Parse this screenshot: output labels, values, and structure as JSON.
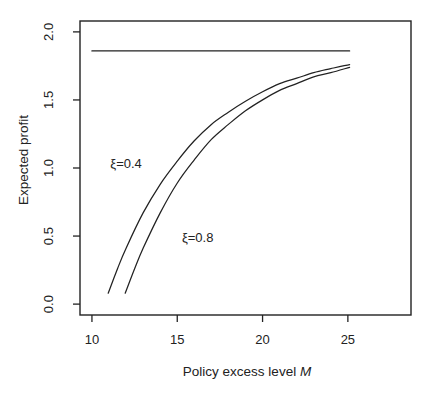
{
  "window": {
    "width": 430,
    "height": 397
  },
  "figure": {
    "background": "#ffffff",
    "ink_color": "#222222"
  },
  "chart_data": {
    "type": "line",
    "title": "",
    "xlabel": "Policy excess level M",
    "xlabel_text": "Policy excess level ",
    "xlabel_var": "M",
    "ylabel": "Expected profit",
    "xlim": [
      9.3,
      28.7
    ],
    "ylim": [
      -0.08,
      2.08
    ],
    "grid": false,
    "legend": "none",
    "x_ticks": {
      "values": [
        10,
        15,
        20,
        25
      ],
      "labels": [
        "10",
        "15",
        "20",
        "25"
      ]
    },
    "y_ticks": {
      "values": [
        0.0,
        0.5,
        1.0,
        1.5,
        2.0
      ],
      "labels": [
        "0.0",
        "0.5",
        "1.0",
        "1.5",
        "2.0"
      ]
    },
    "series": [
      {
        "name": "maximum-profit-reference-line",
        "style": "straight",
        "points": [
          [
            10,
            1.86
          ],
          [
            25.1,
            1.86
          ]
        ]
      },
      {
        "name": "expected-profit-xi-0.4",
        "annotation": "ξ=0.4",
        "style": "smooth",
        "points": [
          [
            10.95,
            0.08
          ],
          [
            11.5,
            0.26
          ],
          [
            12,
            0.41
          ],
          [
            13,
            0.67
          ],
          [
            14,
            0.88
          ],
          [
            15,
            1.05
          ],
          [
            16,
            1.2
          ],
          [
            17,
            1.32
          ],
          [
            18,
            1.41
          ],
          [
            19,
            1.49
          ],
          [
            20,
            1.56
          ],
          [
            21,
            1.62
          ],
          [
            22,
            1.66
          ],
          [
            23,
            1.7
          ],
          [
            24,
            1.73
          ],
          [
            25.1,
            1.76
          ]
        ]
      },
      {
        "name": "expected-profit-xi-0.8",
        "annotation": "ξ=0.8",
        "style": "smooth",
        "points": [
          [
            11.95,
            0.08
          ],
          [
            12.5,
            0.26
          ],
          [
            13,
            0.41
          ],
          [
            14,
            0.67
          ],
          [
            15,
            0.89
          ],
          [
            16,
            1.06
          ],
          [
            17,
            1.21
          ],
          [
            18,
            1.32
          ],
          [
            19,
            1.42
          ],
          [
            20,
            1.5
          ],
          [
            21,
            1.57
          ],
          [
            22,
            1.62
          ],
          [
            23,
            1.67
          ],
          [
            24,
            1.7
          ],
          [
            25.1,
            1.74
          ]
        ]
      }
    ],
    "annotations": [
      {
        "text": "ξ=0.4",
        "x": 12.0,
        "y": 1.03,
        "series": "expected-profit-xi-0.4"
      },
      {
        "text": "ξ=0.8",
        "x": 16.2,
        "y": 0.49,
        "series": "expected-profit-xi-0.8"
      }
    ]
  }
}
